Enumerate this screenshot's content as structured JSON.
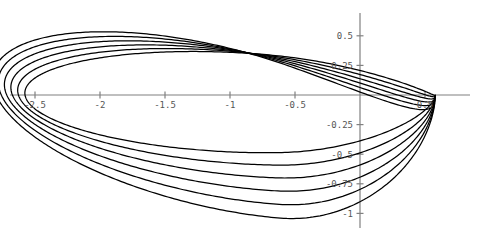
{
  "chart_data": {
    "type": "line",
    "title": "",
    "subtitle": "",
    "xlabel": "",
    "ylabel": "",
    "grid": false,
    "legend": "none",
    "axis_style": "centered-spines",
    "xlim": [
      -2.72,
      0.72
    ],
    "ylim": [
      -1.12,
      0.62
    ],
    "xticks": [
      -2.5,
      -2,
      -1.5,
      -1,
      -0.5,
      0.5
    ],
    "xtick_labels": [
      "-2.5",
      "-2",
      "-1.5",
      "-1",
      "-0.5",
      "0.5"
    ],
    "yticks": [
      0.5,
      0.25,
      -0.25,
      -0.5,
      -0.75,
      -1
    ],
    "ytick_labels": [
      "0.5",
      "0.25",
      "-0.25",
      "-0.5",
      "-0.75",
      "-1"
    ],
    "series_count": 6,
    "series": [
      {
        "name": "loop-1",
        "cx": -1.0,
        "rx": 1.58,
        "ry": 0.42,
        "rot": -3.0,
        "yoff": -0.06
      },
      {
        "name": "loop-2",
        "cx": -1.03,
        "rx": 1.61,
        "ry": 0.47,
        "rot": -5.5,
        "yoff": -0.1
      },
      {
        "name": "loop-3",
        "cx": -1.06,
        "rx": 1.64,
        "ry": 0.52,
        "rot": -8.0,
        "yoff": -0.14
      },
      {
        "name": "loop-4",
        "cx": -1.09,
        "rx": 1.67,
        "ry": 0.57,
        "rot": -10.5,
        "yoff": -0.18
      },
      {
        "name": "loop-5",
        "cx": -1.12,
        "rx": 1.7,
        "ry": 0.62,
        "rot": -13.0,
        "yoff": -0.22
      },
      {
        "name": "loop-6",
        "cx": -1.15,
        "rx": 1.73,
        "ry": 0.67,
        "rot": -15.5,
        "yoff": -0.26
      }
    ],
    "cusp_point": [
      0.58,
      0.0
    ],
    "colors": {
      "curve": "#000000",
      "axis": "#808080",
      "tick_label": "#555555",
      "background": "#ffffff"
    }
  },
  "geometry": {
    "origin_px": [
      360,
      95
    ],
    "x_scale_px_per_unit": 130,
    "y_scale_px_per_unit": 118.4,
    "x_axis_span_px": [
      10,
      470
    ],
    "y_axis_span_px": [
      13,
      228
    ]
  }
}
